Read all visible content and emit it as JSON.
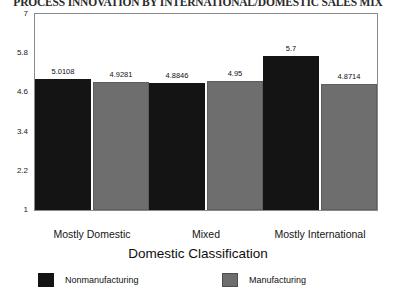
{
  "chart_data": {
    "type": "bar",
    "title": "PROCESS INNOVATION BY INTERNATIONAL/DOMESTIC SALES MIX",
    "xlabel": "Domestic Classification",
    "ylabel": "",
    "categories": [
      "Mostly Domestic",
      "Mixed",
      "Mostly International"
    ],
    "series": [
      {
        "name": "Nonmanufacturing",
        "color": "#141414",
        "values": [
          5.0108,
          4.8846,
          5.7
        ],
        "labels": [
          "5.0108",
          "4.8846",
          "5.7"
        ]
      },
      {
        "name": "Manufacturing",
        "color": "#6e6e6e",
        "values": [
          4.9281,
          4.95,
          4.8714
        ],
        "labels": [
          "4.9281",
          "4.95",
          "4.8714"
        ]
      }
    ],
    "ylim": [
      1,
      7
    ],
    "yticks": [
      7,
      5.8,
      4.6,
      3.4,
      2.2,
      1
    ],
    "ytick_labels": [
      "7",
      "5.8",
      "4.6",
      "3.4",
      "2.2",
      "1"
    ],
    "grid": false,
    "legend_position": "bottom"
  },
  "legend": {
    "entries": [
      {
        "label": "Nonmanufacturing"
      },
      {
        "label": "Manufacturing"
      }
    ]
  }
}
